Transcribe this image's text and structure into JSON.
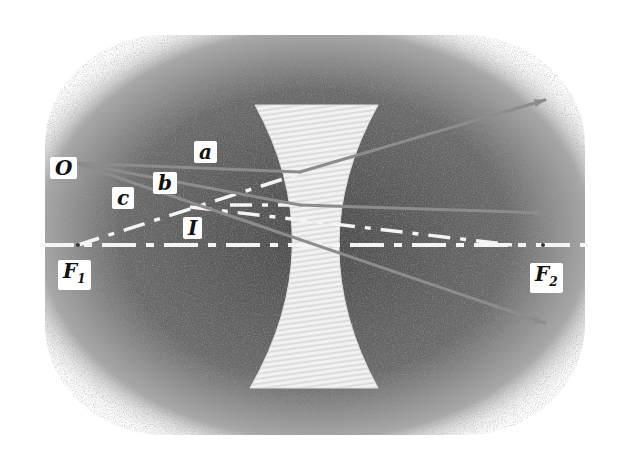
{
  "diagram": {
    "type": "ray-diagram",
    "colors": {
      "background": "#ffffff",
      "shading": "#6e6e6e",
      "lens_fill": "#ececec",
      "ray": "#8a8a8a",
      "dashed_line": "#f4f4f4",
      "label_bg": "#ffffff",
      "label_text": "#111111"
    },
    "labels": {
      "object": "O",
      "ray_a": "a",
      "ray_b": "b",
      "ray_c": "c",
      "image": "I",
      "focus_left": "F",
      "focus_left_sub": "1",
      "focus_right": "F",
      "focus_right_sub": "2"
    },
    "elements": {
      "optical_axis": "dashed horizontal line through F1 and F2",
      "lens": "biconcave lens, hatched",
      "rays": [
        "a: parallel to axis, diverges as if from F1",
        "b: through lens center, undeviated",
        "c: aimed at F2, exits parallel to axis"
      ],
      "virtual_extensions": "dashed back-extensions meeting at image I"
    }
  }
}
